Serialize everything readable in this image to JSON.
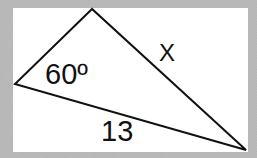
{
  "diagram": {
    "type": "triangle",
    "vertices": {
      "top": [
        92,
        9
      ],
      "left": [
        15,
        84
      ],
      "right": [
        246,
        150
      ]
    },
    "labels": {
      "angle": "60º",
      "side_x": "X",
      "side_base": "13"
    },
    "colors": {
      "line": "#111111",
      "background": "#ffffff",
      "border": "#b8b8b8"
    }
  }
}
